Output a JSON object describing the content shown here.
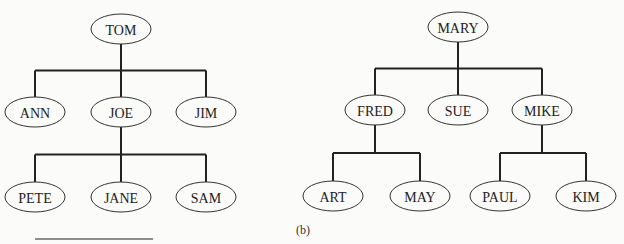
{
  "trees": [
    {
      "id": "a",
      "root": "TOM",
      "nodes": {
        "TOM": {
          "label": "TOM",
          "cx": 121,
          "cy": 29
        },
        "ANN": {
          "label": "ANN",
          "cx": 35,
          "cy": 112
        },
        "JOE": {
          "label": "JOE",
          "cx": 121,
          "cy": 112
        },
        "JIM": {
          "label": "JIM",
          "cx": 206,
          "cy": 112
        },
        "PETE": {
          "label": "PETE",
          "cx": 35,
          "cy": 197
        },
        "JANE": {
          "label": "JANE",
          "cx": 121,
          "cy": 197
        },
        "SAM": {
          "label": "SAM",
          "cx": 206,
          "cy": 197
        }
      },
      "children": {
        "TOM": [
          "ANN",
          "JOE",
          "JIM"
        ],
        "JOE": [
          "PETE",
          "JANE",
          "SAM"
        ]
      }
    },
    {
      "id": "b",
      "caption": "(b)",
      "root": "MARY",
      "nodes": {
        "MARY": {
          "label": "MARY",
          "cx": 458,
          "cy": 27
        },
        "FRED": {
          "label": "FRED",
          "cx": 375,
          "cy": 110
        },
        "SUE": {
          "label": "SUE",
          "cx": 458,
          "cy": 110
        },
        "MIKE": {
          "label": "MIKE",
          "cx": 542,
          "cy": 110
        },
        "ART": {
          "label": "ART",
          "cx": 333,
          "cy": 196
        },
        "MAY": {
          "label": "MAY",
          "cx": 420,
          "cy": 196
        },
        "PAUL": {
          "label": "PAUL",
          "cx": 500,
          "cy": 196
        },
        "KIM": {
          "label": "KIM",
          "cx": 586,
          "cy": 196
        }
      },
      "children": {
        "MARY": [
          "FRED",
          "SUE",
          "MIKE"
        ],
        "FRED": [
          "ART",
          "MAY"
        ],
        "MIKE": [
          "PAUL",
          "KIM"
        ]
      }
    }
  ],
  "labels": {
    "caption_b": "(b)"
  }
}
